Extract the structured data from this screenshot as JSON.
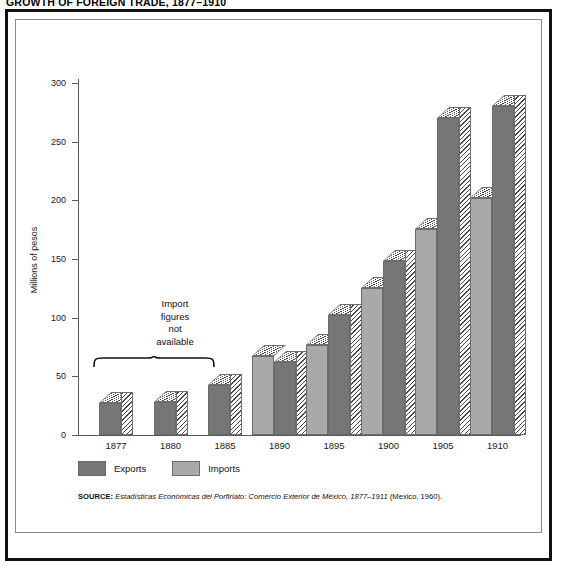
{
  "figure": {
    "title": "GROWTH OF FOREIGN TRADE, 1877–1910"
  },
  "annotation": {
    "line1": "Import",
    "line2": "figures",
    "line3": "not",
    "line4": "available",
    "spans_years": [
      "1877",
      "1880",
      "1885"
    ]
  },
  "legend": {
    "position": "below-plot",
    "items": [
      {
        "label": "Exports",
        "color": "#767676"
      },
      {
        "label": "Imports",
        "color": "#a9a9a9"
      }
    ]
  },
  "source": {
    "label": "SOURCE:",
    "title": "Estadísticas Económicas del Porfiriato: Comercio Exterior de México, 1877–1911",
    "publication": "(Mexico, 1960)."
  },
  "chart_data": {
    "type": "bar",
    "title": "GROWTH OF FOREIGN TRADE, 1877–1910",
    "xlabel": "",
    "ylabel": "Millions of pesos",
    "ylim": [
      0,
      300
    ],
    "yticks": [
      0,
      50,
      100,
      150,
      200,
      250,
      300
    ],
    "ytick_labels": [
      "0",
      "50",
      "100",
      "150",
      "200",
      "250",
      "300"
    ],
    "grid": false,
    "categories": [
      "1877",
      "1880",
      "1885",
      "1890",
      "1895",
      "1900",
      "1905",
      "1910"
    ],
    "series": [
      {
        "name": "Imports",
        "color": "#a9a9a9",
        "values": [
          null,
          null,
          null,
          67,
          77,
          125,
          176,
          202
        ]
      },
      {
        "name": "Exports",
        "color": "#767676",
        "values": [
          27,
          28,
          43,
          62,
          102,
          148,
          270,
          280
        ]
      }
    ]
  }
}
